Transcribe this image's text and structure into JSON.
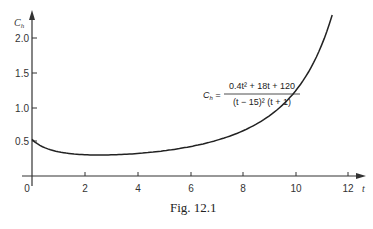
{
  "chart_data": {
    "type": "line",
    "title": "",
    "xlabel": "t",
    "ylabel": "C_h",
    "xlim": [
      0,
      12
    ],
    "ylim": [
      0,
      2.3
    ],
    "grid": false,
    "x_ticks": [
      "0",
      "2",
      "4",
      "6",
      "8",
      "10",
      "12"
    ],
    "y_ticks": [
      "0.5",
      "1.0",
      "1.5",
      "2.0"
    ],
    "series": [
      {
        "name": "C_h",
        "x": [
          0,
          1,
          2,
          3,
          4,
          5,
          6,
          7,
          8,
          9,
          10,
          11,
          11.5
        ],
        "y": [
          0.533,
          0.353,
          0.311,
          0.308,
          0.328,
          0.367,
          0.428,
          0.519,
          0.657,
          0.873,
          1.236,
          1.908,
          2.481
        ]
      }
    ],
    "annotations": [
      {
        "text": "C_h = (0.4t^2 + 18t + 120) / ((t - 15)^2 (t + 1))",
        "lhs": "C",
        "lhs_sub": "h",
        "numerator": "0.4t² + 18t + 120",
        "denominator": "(t − 15)² (t + 1)"
      }
    ]
  },
  "axes": {
    "y_label": "C",
    "y_label_sub": "h",
    "x_label": "t",
    "origin_label": "0"
  },
  "caption": "Fig. 12.1"
}
